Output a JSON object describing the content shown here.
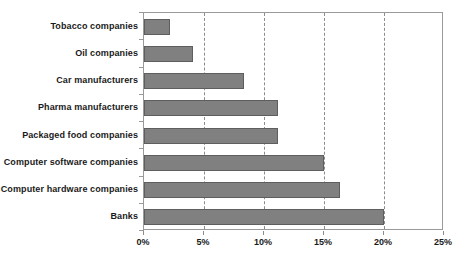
{
  "chart_data": {
    "type": "bar",
    "orientation": "horizontal",
    "title": "",
    "subtitle": "",
    "xlabel": "",
    "ylabel": "",
    "xlim": [
      0,
      25
    ],
    "ylim": null,
    "grid": true,
    "legend": null,
    "legend_position": "none",
    "x_tick_labels": [
      "0%",
      "5%",
      "10%",
      "15%",
      "20%",
      "25%"
    ],
    "x_tick_values": [
      0,
      5,
      10,
      15,
      20,
      25
    ],
    "categories": [
      "Tobacco companies",
      "Oil companies",
      "Car manufacturers",
      "Pharma manufacturers",
      "Packaged food companies",
      "Computer software companies",
      "Computer hardware companies",
      "Banks"
    ],
    "values": [
      2.2,
      4.1,
      8.3,
      11.2,
      11.2,
      15.0,
      16.3,
      20.0
    ],
    "units": "percent",
    "bar_color": "#808080",
    "bar_border_color": "#5e5e5e",
    "gridline_color": "#8c8c8c",
    "axis_color": "#9a9a9a",
    "text_color": "#1a1a1a",
    "plot_background": "#ffffff"
  }
}
